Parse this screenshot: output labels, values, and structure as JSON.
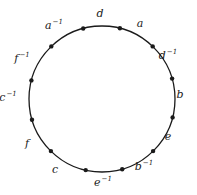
{
  "diagram": {
    "type": "polygon-circle",
    "stroke_color": "#1a1a1a",
    "background": "#ffffff",
    "circle": {
      "cx": 102,
      "cy": 99,
      "r": 73
    },
    "edges": [
      {
        "base": "d",
        "exp": "",
        "x": 100,
        "y": 17
      },
      {
        "base": "a",
        "exp": "",
        "x": 140,
        "y": 27
      },
      {
        "base": "d",
        "exp": "−1",
        "x": 168,
        "y": 59
      },
      {
        "base": "b",
        "exp": "",
        "x": 180,
        "y": 98
      },
      {
        "base": "e",
        "exp": "",
        "x": 168,
        "y": 140
      },
      {
        "base": "b",
        "exp": "−1",
        "x": 144,
        "y": 170
      },
      {
        "base": "e",
        "exp": "−1",
        "x": 103,
        "y": 186
      },
      {
        "base": "c",
        "exp": "",
        "x": 55,
        "y": 173
      },
      {
        "base": "f",
        "exp": "",
        "x": 27,
        "y": 147
      },
      {
        "base": "c",
        "exp": "−1",
        "x": 8,
        "y": 101
      },
      {
        "base": "f",
        "exp": "−1",
        "x": 22,
        "y": 62
      },
      {
        "base": "a",
        "exp": "−1",
        "x": 54,
        "y": 29
      }
    ],
    "vertices": [
      [
        82,
        24
      ],
      [
        121,
        24
      ],
      [
        155,
        44
      ],
      [
        174,
        78
      ],
      [
        175,
        118
      ],
      [
        155,
        153
      ],
      [
        123,
        172
      ],
      [
        85,
        173
      ],
      [
        50,
        152
      ],
      [
        31,
        120
      ],
      [
        30,
        80
      ],
      [
        49,
        44
      ]
    ]
  }
}
